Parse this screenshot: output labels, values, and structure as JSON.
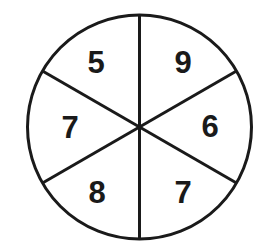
{
  "diagram": {
    "type": "number-wheel",
    "center": [
      139.5,
      127
    ],
    "radius": 112,
    "stroke_color": "#1a1a1a",
    "background_color": "#ffffff",
    "sectors": [
      {
        "position": "top-left",
        "value": "5",
        "label_xy": [
          96,
          62
        ]
      },
      {
        "position": "top-right",
        "value": "9",
        "label_xy": [
          183,
          62
        ]
      },
      {
        "position": "right",
        "value": "6",
        "label_xy": [
          210,
          126
        ]
      },
      {
        "position": "bottom-right",
        "value": "7",
        "label_xy": [
          183,
          192
        ]
      },
      {
        "position": "bottom-left",
        "value": "8",
        "label_xy": [
          97,
          192
        ]
      },
      {
        "position": "left",
        "value": "7",
        "label_xy": [
          70,
          127
        ]
      }
    ]
  }
}
